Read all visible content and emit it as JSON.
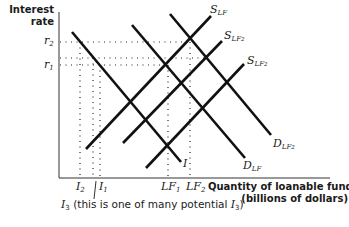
{
  "diagram": {
    "type": "loanable-funds-market",
    "y_axis": {
      "label_line1": "Interest",
      "label_line2": "rate",
      "ticks": [
        "r2",
        "r1"
      ]
    },
    "x_axis": {
      "label_line1": "Quantity of loanable funds",
      "label_line2": "(billions of dollars)",
      "ticks": [
        "I2",
        "I1",
        "LF1",
        "LF2"
      ]
    },
    "curves": [
      {
        "id": "S_LF",
        "label_main": "S",
        "label_sub": "LF",
        "label_sub2": ""
      },
      {
        "id": "S_LF2_a",
        "label_main": "S",
        "label_sub": "LF",
        "label_sub2": "2"
      },
      {
        "id": "S_LF2_b",
        "label_main": "S",
        "label_sub": "LF",
        "label_sub2": "2"
      },
      {
        "id": "D_LF",
        "label_main": "D",
        "label_sub": "LF",
        "label_sub2": ""
      },
      {
        "id": "D_LF2",
        "label_main": "D",
        "label_sub": "LF",
        "label_sub2": "2"
      },
      {
        "id": "I",
        "label_main": "I",
        "label_sub": "",
        "label_sub2": ""
      }
    ],
    "labels": {
      "r2_main": "r",
      "r2_sub": "2",
      "r1_main": "r",
      "r1_sub": "1",
      "i2_main": "I",
      "i2_sub": "2",
      "i1_main": "I",
      "i1_sub": "1",
      "lf1_main": "LF",
      "lf1_sub": "1",
      "lf2_main": "LF",
      "lf2_sub": "2",
      "i3_main": "I",
      "i3_sub": "3",
      "i3_caption_mid": " (this is one of many potential ",
      "i3_caption_end_main": "I",
      "i3_caption_end_sub": "3",
      "i3_caption_close": ")"
    }
  }
}
